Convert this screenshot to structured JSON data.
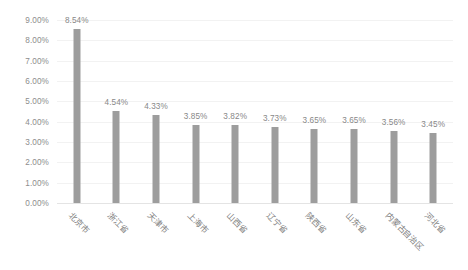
{
  "chart_data": {
    "type": "bar",
    "title": "",
    "subtitle": "",
    "xlabel": "",
    "ylabel": "",
    "categories": [
      "北京市",
      "浙江省",
      "天津市",
      "上海市",
      "山西省",
      "辽宁省",
      "陕西省",
      "山东省",
      "内蒙古自治区",
      "河北省"
    ],
    "values": [
      8.54,
      4.54,
      4.33,
      3.85,
      3.82,
      3.73,
      3.65,
      3.65,
      3.56,
      3.45
    ],
    "value_labels": [
      "8.54%",
      "4.54%",
      "4.33%",
      "3.85%",
      "3.82%",
      "3.73%",
      "3.65%",
      "3.65%",
      "3.56%",
      "3.45%"
    ],
    "ylim": [
      0,
      9
    ],
    "ytick_values": [
      9,
      8,
      7,
      6,
      5,
      4,
      3,
      2,
      1,
      0
    ],
    "ytick_labels": [
      "9.00%",
      "8.00%",
      "7.00%",
      "6.00%",
      "5.00%",
      "4.00%",
      "3.00%",
      "2.00%",
      "1.00%",
      "0.00%"
    ],
    "grid": true,
    "legend": false,
    "legend_position": "none",
    "series_color": "#9d9d9d",
    "gridline_color": "#f2f2f2",
    "axis_text_color": "#8d8d8d",
    "background_color": "#ffffff"
  }
}
